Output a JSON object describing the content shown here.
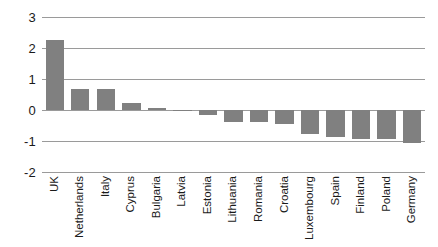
{
  "chart_data": {
    "type": "bar",
    "title": "",
    "subtitle": "",
    "xlabel": "",
    "ylabel": "",
    "ylim": [
      -2,
      3
    ],
    "yticks": [
      3,
      2,
      1,
      0,
      -1,
      -2
    ],
    "ytick_labels": [
      "3",
      "2",
      "1",
      "0",
      "-1",
      "-2"
    ],
    "grid": true,
    "legend": false,
    "legend_position": "none",
    "bar_color": "#808080",
    "gridline_color": "#9a9a9a",
    "categories": [
      "UK",
      "Netherlands",
      "Italy",
      "Cyprus",
      "Bulgaria",
      "Latvia",
      "Estonia",
      "Lithuania",
      "Romania",
      "Croatia",
      "Luxembourg",
      "Spain",
      "Finland",
      "Poland",
      "Germany"
    ],
    "values": [
      2.26,
      0.68,
      0.67,
      0.24,
      0.08,
      -0.03,
      -0.17,
      -0.38,
      -0.4,
      -0.44,
      -0.78,
      -0.88,
      -0.92,
      -0.92,
      -1.06
    ]
  }
}
